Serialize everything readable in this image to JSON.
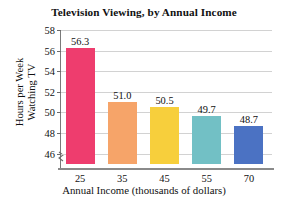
{
  "chart_data": {
    "type": "bar",
    "title": "Television Viewing, by Annual Income",
    "xlabel": "Annual Income (thousands of dollars)",
    "ylabel_line1": "Hours per Week",
    "ylabel_line2": "Watching TV",
    "categories": [
      "25",
      "35",
      "45",
      "55",
      "70"
    ],
    "values": [
      56.3,
      51.0,
      50.5,
      49.7,
      48.7
    ],
    "value_labels": [
      "56.3",
      "51.0",
      "50.5",
      "49.7",
      "48.7"
    ],
    "bar_colors": [
      "#EE3D6E",
      "#F6A469",
      "#F7CF3C",
      "#72C0C5",
      "#4B72C3"
    ],
    "ytick_labels": [
      "46",
      "48",
      "50",
      "52",
      "54",
      "56",
      "58"
    ],
    "ytick_values": [
      46,
      48,
      50,
      52,
      54,
      56,
      58
    ],
    "ylim": [
      45.0,
      58.0
    ],
    "grid": "horizontal",
    "legend": "none",
    "axis_break": "y-axis break below 46"
  },
  "colors": {
    "grid": "#d2d2d2",
    "axis": "#8a8a8a",
    "text": "#111111",
    "background": "#ffffff"
  }
}
